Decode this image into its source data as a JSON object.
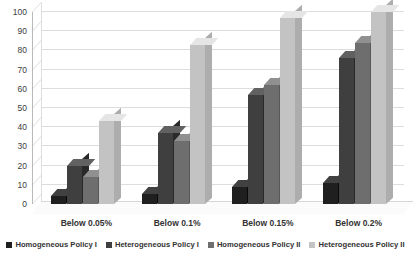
{
  "chart_data": {
    "type": "bar",
    "title": "",
    "subtitle": "",
    "xlabel": "",
    "ylabel": "",
    "categories": [
      "Below 0.05%",
      "Below 0.1%",
      "Below 0.15%",
      "Below 0.2%"
    ],
    "series": [
      {
        "name": "Homogeneous Policy I",
        "color": "#1f1f1f",
        "values": [
          4,
          5,
          9,
          11
        ]
      },
      {
        "name": "Heterogeneous Policy I",
        "color": "#3f3f3f",
        "values": [
          20,
          37,
          57,
          76
        ]
      },
      {
        "name": "Homogeneous Policy II",
        "color": "#6e6e6e",
        "values": [
          14,
          33,
          62,
          84
        ]
      },
      {
        "name": "Heterogeneous Policy II",
        "color": "#c3c3c3",
        "values": [
          43,
          83,
          97,
          100
        ]
      }
    ],
    "yticks": [
      0,
      10,
      20,
      30,
      40,
      50,
      60,
      70,
      80,
      90,
      100
    ],
    "ylim": [
      0,
      100
    ],
    "grid": true,
    "legend_position": "bottom",
    "style_3d": true,
    "plot_background": "#ffffff",
    "gridline_color": "#dddddd",
    "axis_color": "#b9b9b9",
    "text_color": "#333333"
  }
}
